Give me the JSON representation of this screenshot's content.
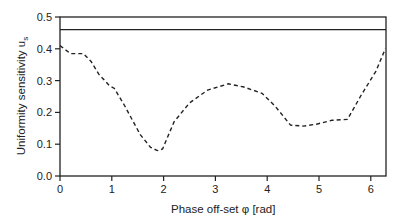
{
  "chart_data": {
    "type": "line",
    "title": "",
    "xlabel": "Phase off-set φ   [rad]",
    "ylabel": "Uniformity sensitivity u",
    "ylabel_subscript": "s",
    "xlim": [
      0,
      6.28
    ],
    "ylim": [
      0,
      0.5
    ],
    "x_ticks": [
      "0",
      "1",
      "2",
      "3",
      "4",
      "5",
      "6"
    ],
    "y_ticks": [
      "0.0",
      "0.1",
      "0.2",
      "0.3",
      "0.4",
      "0.5"
    ],
    "grid": false,
    "reference_line": {
      "y": 0.46,
      "style": "solid"
    },
    "series": [
      {
        "name": "u_s",
        "style": "dashed",
        "x": [
          0.0,
          0.2,
          0.45,
          0.6,
          0.75,
          0.95,
          1.05,
          1.25,
          1.55,
          1.75,
          1.88,
          1.98,
          2.2,
          2.5,
          2.85,
          3.25,
          3.55,
          3.9,
          4.15,
          4.45,
          4.7,
          4.95,
          5.25,
          5.55,
          5.8,
          6.1,
          6.28
        ],
        "y": [
          0.41,
          0.385,
          0.385,
          0.36,
          0.32,
          0.285,
          0.275,
          0.22,
          0.13,
          0.09,
          0.08,
          0.085,
          0.17,
          0.23,
          0.27,
          0.29,
          0.28,
          0.26,
          0.22,
          0.16,
          0.157,
          0.163,
          0.175,
          0.178,
          0.25,
          0.33,
          0.4
        ]
      }
    ]
  }
}
